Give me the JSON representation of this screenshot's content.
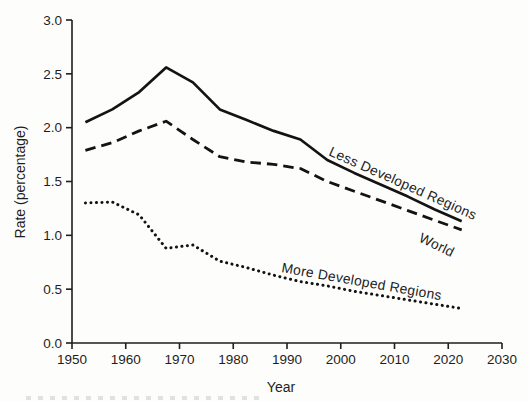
{
  "figure": {
    "background": "#fdfdfc",
    "ink": "#1e1e1e"
  },
  "chart_data": {
    "type": "line",
    "title": "",
    "xlabel": "Year",
    "ylabel": "Rate (percentage)",
    "xlim": [
      1950,
      2030
    ],
    "ylim": [
      0.0,
      3.0
    ],
    "x_ticks": [
      1950,
      1960,
      1970,
      1980,
      1990,
      2000,
      2010,
      2020,
      2030
    ],
    "y_ticks": [
      0,
      0.5,
      1,
      1.5,
      2,
      2.5,
      3
    ],
    "y_tick_labels": [
      "0.0",
      "0.5",
      "1.0",
      "1.5",
      "2.0",
      "2.5",
      "3.0"
    ],
    "grid": false,
    "legend_position": "inline-labels-on-lines",
    "x": [
      1952.5,
      1957.5,
      1962.5,
      1967.5,
      1972.5,
      1977.5,
      1982.5,
      1987.5,
      1992.5,
      1997.5,
      2002.5,
      2007.5,
      2012.5,
      2017.5,
      2022.5
    ],
    "series": [
      {
        "name": "Less Developed Regions",
        "line_style": "solid",
        "color": "#131313",
        "values": [
          2.05,
          2.17,
          2.33,
          2.56,
          2.42,
          2.17,
          2.07,
          1.97,
          1.89,
          1.7,
          1.58,
          1.47,
          1.36,
          1.24,
          1.13
        ],
        "label_anchor": {
          "x": 328,
          "y": 155,
          "angle": 24
        }
      },
      {
        "name": "World",
        "line_style": "dashed",
        "color": "#131313",
        "values": [
          1.79,
          1.86,
          1.97,
          2.06,
          1.89,
          1.73,
          1.68,
          1.66,
          1.62,
          1.5,
          1.41,
          1.32,
          1.23,
          1.14,
          1.05
        ],
        "label_anchor": {
          "x": 418,
          "y": 241,
          "angle": 26
        }
      },
      {
        "name": "More Developed Regions",
        "line_style": "dotted",
        "color": "#131313",
        "values": [
          1.3,
          1.31,
          1.19,
          0.88,
          0.91,
          0.76,
          0.7,
          0.63,
          0.57,
          0.53,
          0.48,
          0.44,
          0.4,
          0.36,
          0.32
        ],
        "label_anchor": {
          "x": 281,
          "y": 272,
          "angle": 10
        }
      }
    ],
    "plot_area_px": {
      "left": 72,
      "top": 20,
      "right": 502,
      "bottom": 343
    }
  }
}
